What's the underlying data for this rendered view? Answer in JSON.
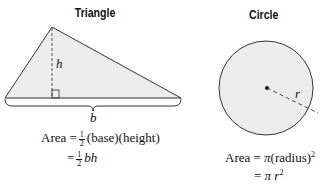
{
  "triangle": {
    "title": "Triangle",
    "height_label": "h",
    "base_label": "b",
    "formula_line1": {
      "prefix": "Area =",
      "frac_num": "1",
      "frac_den": "2",
      "rest": "(base)(height)"
    },
    "formula_line2": {
      "prefix": "=",
      "frac_num": "1",
      "frac_den": "2",
      "rest": "bh"
    }
  },
  "circle": {
    "title": "Circle",
    "radius_label": "r",
    "formula_line1": {
      "prefix": "Area = ",
      "pi": "π",
      "rest": "(radius)",
      "exp": "2"
    },
    "formula_line2": {
      "prefix": "= ",
      "pi": "π",
      "var": "r",
      "exp": "2"
    }
  },
  "colors": {
    "fill": "#ececec",
    "stroke": "#333333"
  }
}
